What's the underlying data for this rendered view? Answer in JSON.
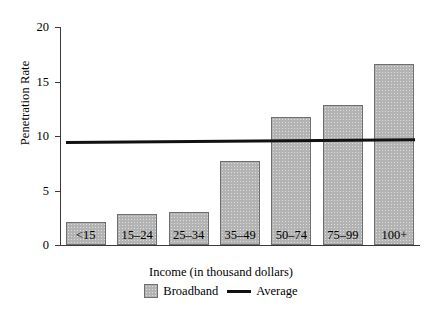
{
  "chart_data": {
    "type": "bar",
    "title": "",
    "xlabel": "Income (in thousand dollars)",
    "ylabel": "Penetration Rate",
    "categories": [
      "<15",
      "15–24",
      "25–34",
      "35–49",
      "50–74",
      "75–99",
      "100+"
    ],
    "series": [
      {
        "name": "Broadband",
        "type": "bar",
        "values": [
          2.1,
          2.8,
          3.0,
          7.7,
          11.7,
          12.8,
          16.6
        ]
      },
      {
        "name": "Average",
        "type": "line",
        "values": [
          9.6,
          9.6,
          9.65,
          9.7,
          9.7,
          9.75,
          9.8
        ],
        "endpoints": [
          9.55,
          9.8
        ]
      }
    ],
    "ylim": [
      0,
      20
    ],
    "yticks": [
      0,
      5,
      10,
      15,
      20
    ],
    "yticklabels": [
      "0",
      "5",
      "10",
      "15",
      "20"
    ],
    "grid": false,
    "legend_position": "bottom",
    "colors": {
      "bar_fill": "#b3b3b3",
      "bar_edge": "#6e6e6e",
      "average_line": "#111111",
      "axis": "#3a3a3a",
      "background": "#ffffff",
      "text": "#000000"
    }
  },
  "legend": {
    "entries": [
      {
        "label": "Broadband",
        "marker": "square-swatch"
      },
      {
        "label": "Average",
        "marker": "line-swatch"
      }
    ]
  }
}
